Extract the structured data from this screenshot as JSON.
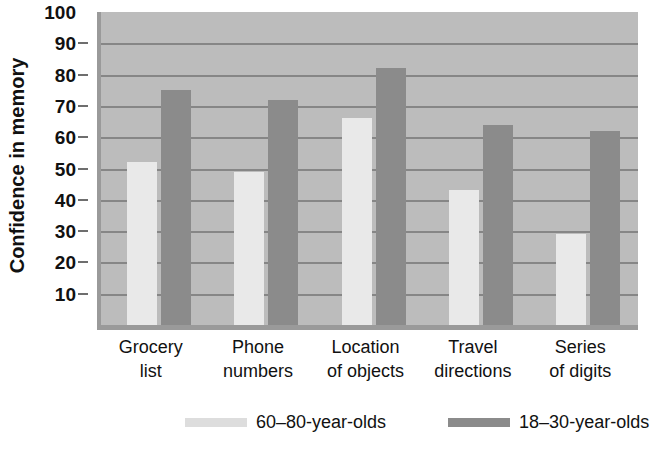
{
  "chart_data": {
    "type": "bar",
    "title": "",
    "xlabel": "",
    "ylabel": "Confidence in memory",
    "ylim": [
      0,
      100
    ],
    "ytick_values": [
      100,
      90,
      80,
      70,
      60,
      50,
      40,
      30,
      20,
      10
    ],
    "ytick_labels": [
      "100",
      "90",
      "80",
      "70",
      "60",
      "50",
      "40",
      "30",
      "20",
      "10"
    ],
    "grid": true,
    "legend_position": "bottom",
    "categories": [
      "Grocery list",
      "Phone numbers",
      "Location of objects",
      "Travel directions",
      "Series of digits"
    ],
    "category_lines": [
      [
        "Grocery",
        "list"
      ],
      [
        "Phone",
        "numbers"
      ],
      [
        "Location",
        "of objects"
      ],
      [
        "Travel",
        "directions"
      ],
      [
        "Series",
        "of digits"
      ]
    ],
    "series": [
      {
        "name": "60–80-year-olds",
        "color": "#e9e9e9",
        "values": [
          52,
          49,
          66,
          43,
          29
        ]
      },
      {
        "name": "18–30-year-olds",
        "color": "#8b8b8b",
        "values": [
          75,
          72,
          82,
          64,
          62
        ]
      }
    ],
    "plot_background": "#bcbcbc",
    "gridline_color": "#868686",
    "axis_color": "#9a9a9a"
  },
  "legend": {
    "items": [
      {
        "label": "60–80-year-olds",
        "swatch": "light"
      },
      {
        "label": "18–30-year-olds",
        "swatch": "dark"
      }
    ]
  }
}
